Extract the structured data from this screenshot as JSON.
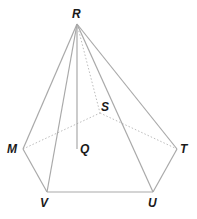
{
  "diagram": {
    "type": "pentagonal pyramid",
    "apex": "R",
    "base_vertices": [
      "M",
      "V",
      "U",
      "T",
      "S"
    ],
    "foot_of_altitude": "Q",
    "labels": {
      "R": "R",
      "S": "S",
      "M": "M",
      "Q": "Q",
      "T": "T",
      "V": "V",
      "U": "U"
    },
    "edges_solid": [
      "RM",
      "RV",
      "RU",
      "RT",
      "RQ",
      "MV",
      "VU",
      "UT"
    ],
    "edges_dashed": [
      "RS",
      "MS",
      "ST"
    ],
    "colors": {
      "edge": "#a9a9a9",
      "label": "#1a1a1a",
      "background": "#ffffff"
    }
  }
}
